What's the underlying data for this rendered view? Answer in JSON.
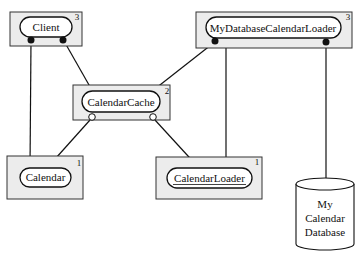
{
  "diagram": {
    "nodes": [
      {
        "id": "client",
        "label": "Client",
        "count": "3"
      },
      {
        "id": "my-database-calendar-loader",
        "label": "MyDatabaseCalendarLoader",
        "count": "3"
      },
      {
        "id": "calendar-cache",
        "label": "CalendarCache",
        "count": "2"
      },
      {
        "id": "calendar",
        "label": "Calendar",
        "count": "1"
      },
      {
        "id": "calendar-loader",
        "label": "CalendarLoader",
        "count": "1",
        "underlined": true
      },
      {
        "id": "database",
        "label_lines": [
          "My",
          "Calendar",
          "Database"
        ]
      }
    ],
    "edges": [
      {
        "from": "client",
        "to": "calendar",
        "from_end": "filled-dot"
      },
      {
        "from": "client",
        "to": "calendar-cache",
        "from_end": "filled-dot"
      },
      {
        "from": "my-database-calendar-loader",
        "to": "calendar-cache",
        "from_end": "filled-dot"
      },
      {
        "from": "my-database-calendar-loader",
        "to": "calendar-loader",
        "to_end": "arrow"
      },
      {
        "from": "my-database-calendar-loader",
        "to": "database",
        "from_end": "filled-dot"
      },
      {
        "from": "calendar-cache",
        "to": "calendar",
        "from_end": "open-circle"
      },
      {
        "from": "calendar-cache",
        "to": "calendar-loader",
        "from_end": "open-circle"
      }
    ]
  }
}
